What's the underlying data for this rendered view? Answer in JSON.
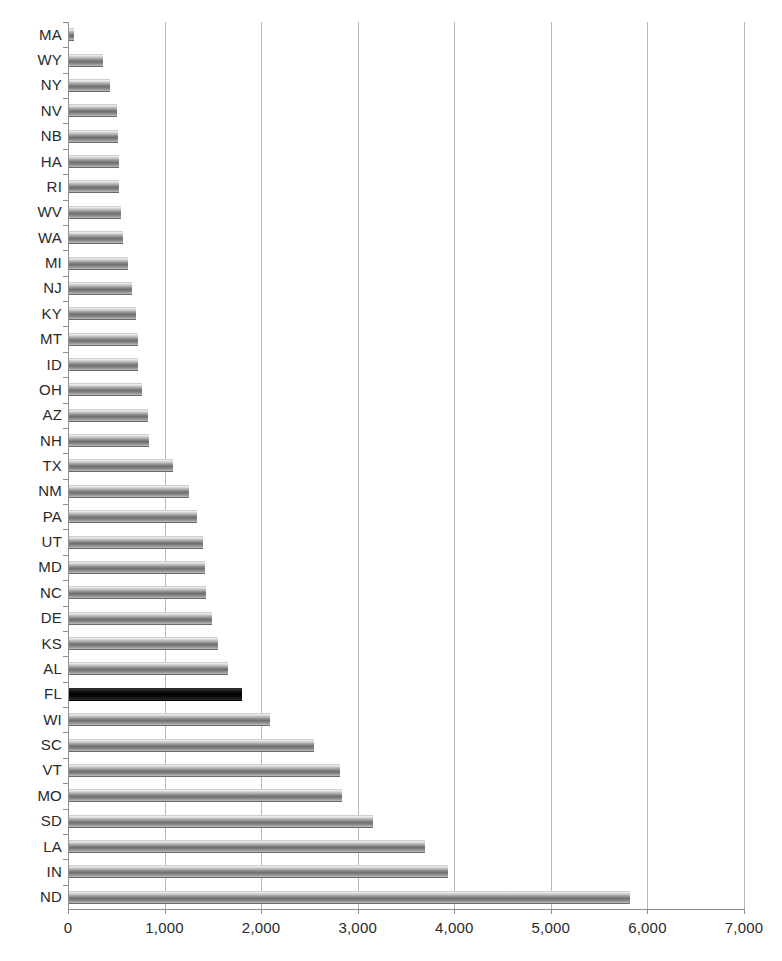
{
  "chart_data": {
    "type": "bar",
    "orientation": "horizontal",
    "title": "",
    "subtitle": "",
    "xlabel": "",
    "ylabel": "",
    "xlim": [
      0,
      7000
    ],
    "ylim": null,
    "grid": "vertical",
    "legend": "none",
    "xticks": [
      "0",
      "1,000",
      "2,000",
      "3,000",
      "4,000",
      "5,000",
      "6,000",
      "7,000"
    ],
    "xtick_values": [
      0,
      1000,
      2000,
      3000,
      4000,
      5000,
      6000,
      7000
    ],
    "categories": [
      "MA",
      "WY",
      "NY",
      "NV",
      "NB",
      "HA",
      "RI",
      "WV",
      "WA",
      "MI",
      "NJ",
      "KY",
      "MT",
      "ID",
      "OH",
      "AZ",
      "NH",
      "TX",
      "NM",
      "PA",
      "UT",
      "MD",
      "NC",
      "DE",
      "KS",
      "AL",
      "FL",
      "WI",
      "SC",
      "VT",
      "MO",
      "SD",
      "LA",
      "IN",
      "ND"
    ],
    "values": [
      60,
      360,
      430,
      505,
      515,
      525,
      530,
      545,
      570,
      625,
      660,
      700,
      720,
      730,
      770,
      825,
      840,
      1085,
      1250,
      1335,
      1400,
      1420,
      1430,
      1490,
      1555,
      1660,
      1800,
      2090,
      2545,
      2820,
      2840,
      3160,
      3700,
      3930,
      5820
    ],
    "highlight_category": "FL",
    "colors": {
      "bar_fill": "#8c8c8c",
      "bar_highlight_fill": "#000000",
      "gridline": "#b8b8b8",
      "axis": "#8f8f8f",
      "text": "#2a2a2a",
      "background": "#ffffff"
    }
  },
  "axis": {
    "x_min_label": "0",
    "x_max_label": "7,000"
  }
}
